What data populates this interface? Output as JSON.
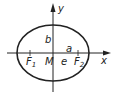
{
  "diagram": {
    "type": "ellipse",
    "axes": {
      "x_label": "x",
      "y_label": "y"
    },
    "labels": {
      "semi_minor": "b",
      "semi_major": "a",
      "center": "M",
      "eccentricity": "e",
      "focus1": "F",
      "focus1_sub": "1",
      "focus2": "F",
      "focus2_sub": "2"
    },
    "colors": {
      "stroke": "#222222",
      "background": "#ffffff"
    }
  }
}
